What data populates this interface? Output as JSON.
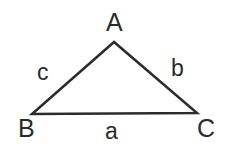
{
  "figure": {
    "type": "geometry-diagram",
    "shape": "triangle",
    "background_color": "#ffffff",
    "stroke_color": "#2b2b2b",
    "stroke_width": 2.5,
    "canvas": {
      "width": 234,
      "height": 157
    },
    "vertices": [
      {
        "name": "A",
        "label": "A",
        "x": 114,
        "y": 42
      },
      {
        "name": "B",
        "label": "B",
        "x": 32,
        "y": 114
      },
      {
        "name": "C",
        "label": "C",
        "x": 197,
        "y": 113
      }
    ],
    "sides": [
      {
        "name": "a",
        "label": "a",
        "opposite_vertex": "A",
        "from": "B",
        "to": "C"
      },
      {
        "name": "b",
        "label": "b",
        "opposite_vertex": "B",
        "from": "C",
        "to": "A"
      },
      {
        "name": "c",
        "label": "c",
        "opposite_vertex": "C",
        "from": "A",
        "to": "B"
      }
    ],
    "path": "M 114,42 L 32,114 L 197,113 Z"
  }
}
